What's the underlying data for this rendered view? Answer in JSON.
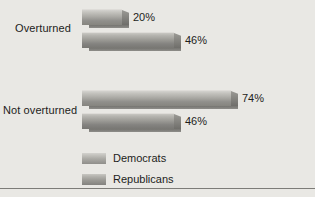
{
  "chart_data": {
    "type": "bar",
    "orientation": "horizontal",
    "title": "",
    "subtitle": "",
    "xlabel": "",
    "ylabel": "",
    "categories": [
      "Overturned",
      "Not overturned"
    ],
    "series": [
      {
        "name": "Democrats",
        "values": [
          20,
          74
        ],
        "value_labels": [
          "20%",
          "74%"
        ],
        "color": "#a9a8a3"
      },
      {
        "name": "Republicans",
        "values": [
          46,
          46
        ],
        "value_labels": [
          "46%",
          "46%"
        ],
        "color": "#9b9a95"
      }
    ],
    "xlim": [
      0,
      100
    ],
    "grid": false,
    "legend_position": "bottom-left",
    "units": "percent"
  },
  "legend": {
    "items": [
      {
        "label": "Democrats"
      },
      {
        "label": "Republicans"
      }
    ]
  },
  "colors": {
    "background": "#e9e8e4",
    "text": "#1d1d1b",
    "rule": "#7d7c78"
  }
}
